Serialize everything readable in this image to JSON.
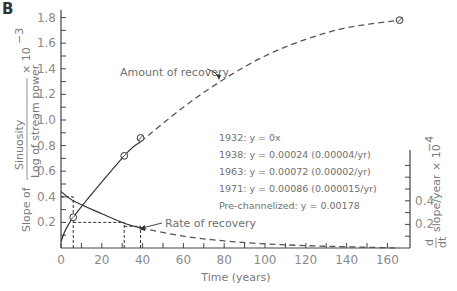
{
  "panel_label": "B",
  "chart_data": {
    "type": "line",
    "title": "",
    "xlabel": "Time (years)",
    "ylabel_left": "Slope of (Sinuosity / Log of stream power) × 10^-3",
    "ylabel_left_parts": {
      "prefix": "Slope of",
      "numerator": "Sinuosity",
      "denominator": "Log of stream power",
      "multiplier": "× 10",
      "exponent": "-3"
    },
    "ylabel_right": "d/dt slope/year × 10^-4",
    "ylabel_right_parts": {
      "d": "d",
      "dt": "dt",
      "text": "slope/year × 10",
      "exponent": "-4"
    },
    "xlim": [
      0,
      170
    ],
    "ylim_left": [
      0,
      1.85
    ],
    "ylim_right": [
      0,
      0.9
    ],
    "x_ticks": [
      0,
      20,
      40,
      60,
      80,
      100,
      120,
      140,
      160
    ],
    "y_ticks_left": [
      "0.2",
      "0.4",
      "0.6",
      "0.8",
      "1.0",
      "1.2",
      "1.4",
      "1.6",
      "1.8"
    ],
    "y_ticks_right": [
      "0.2",
      "0.4"
    ],
    "series": [
      {
        "name": "Amount of recovery",
        "axis": "left",
        "style": "solid then dashed",
        "x": [
          0,
          6,
          31,
          39,
          60,
          80,
          100,
          120,
          140,
          166
        ],
        "values": [
          0.05,
          0.24,
          0.72,
          0.83,
          1.1,
          1.32,
          1.5,
          1.63,
          1.72,
          1.78
        ],
        "observed_points": [
          {
            "x": 6,
            "y": 0.24,
            "label": "1938"
          },
          {
            "x": 31,
            "y": 0.72,
            "label": "1963"
          },
          {
            "x": 39,
            "y": 0.86,
            "label": "1971"
          },
          {
            "x": 166,
            "y": 1.78,
            "label": "Pre-channelized"
          }
        ]
      },
      {
        "name": "Rate of recovery",
        "axis": "right",
        "style": "solid then dashed",
        "x": [
          0,
          6,
          20,
          31,
          39,
          60,
          80,
          100,
          120,
          140,
          166
        ],
        "values": [
          0.48,
          0.4,
          0.29,
          0.21,
          0.17,
          0.1,
          0.06,
          0.035,
          0.02,
          0.01,
          0.0
        ]
      }
    ],
    "reference_lines": [
      {
        "from": [
          6,
          0
        ],
        "to": [
          6,
          0.4
        ],
        "note": "dashed guide at 6 yrs"
      },
      {
        "from": [
          0,
          0.4
        ],
        "to": [
          6,
          0.4
        ]
      },
      {
        "from": [
          6,
          0.2
        ],
        "to": [
          31,
          0.2
        ]
      },
      {
        "from": [
          31,
          0
        ],
        "to": [
          31,
          0.2
        ]
      },
      {
        "from": [
          39,
          0
        ],
        "to": [
          39,
          0.17
        ]
      }
    ],
    "annotations": [
      "Amount of recovery",
      "Rate of recovery",
      "1932:  y = 0x",
      "1938:  y = 0.00024    (0.00004/yr)",
      "1963:  y = 0.00072    (0.00002/yr)",
      "1971:  y = 0.00086    (0.000015/yr)",
      "Pre-channelized:  y = 0.00178"
    ],
    "grid": false,
    "legend": "none (inline labels)"
  },
  "labels": {
    "amount": "Amount of recovery",
    "rate": "Rate of recovery",
    "xlabel": "Time (years)",
    "slope_of": "Slope of",
    "sinuosity": "Sinuosity",
    "log_power": "Log of stream power",
    "left_mult": "× 10",
    "left_exp": "−3",
    "right_d": "d",
    "right_dt": "dt",
    "right_text": "slope/year × 10",
    "right_exp": "−4"
  },
  "equations": [
    "1932:  y = 0x",
    "1938:  y = 0.00024   (0.00004/yr)",
    "1963:  y = 0.00072   (0.00002/yr)",
    "1971:  y = 0.00086   (0.000015/yr)",
    "Pre-channelized:  y = 0.00178"
  ]
}
